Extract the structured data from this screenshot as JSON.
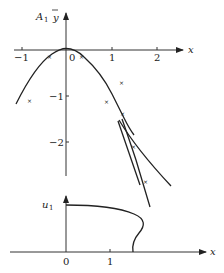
{
  "top_plot": {
    "y_label_main": "A",
    "y_label_sub": "1",
    "y_label_var": "y",
    "x_label": "x",
    "x_ticks": [
      {
        "label": "−1",
        "value": -1
      },
      {
        "label": "0",
        "value": 0
      },
      {
        "label": "1",
        "value": 1
      },
      {
        "label": "2",
        "value": 2
      }
    ],
    "y_ticks": [
      {
        "label": "−1",
        "value": -1
      },
      {
        "label": "−2",
        "value": -2
      }
    ],
    "point_marker": "x"
  },
  "bottom_plot": {
    "y_label_main": "u",
    "y_label_sub": "1",
    "x_label": "x",
    "x_ticks": [
      {
        "label": "0",
        "value": 0
      },
      {
        "label": "1",
        "value": 1
      }
    ]
  },
  "colors": {
    "ink": "#222222",
    "background": "#ffffff"
  }
}
